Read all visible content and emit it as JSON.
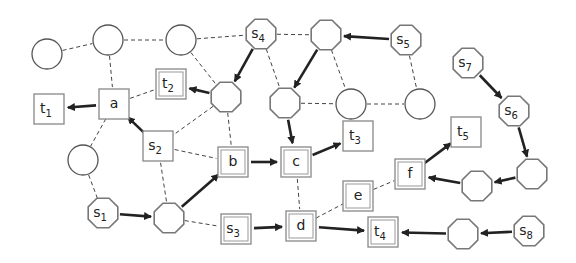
{
  "diagram": {
    "colors": {
      "stroke": "#555555",
      "arrow": "#222222",
      "background": "#ffffff"
    },
    "nodes": [
      {
        "id": "c1",
        "shape": "circle",
        "x": 47,
        "y": 54,
        "label": "",
        "sub": ""
      },
      {
        "id": "c2",
        "shape": "circle",
        "x": 108,
        "y": 40,
        "label": "",
        "sub": ""
      },
      {
        "id": "c3",
        "shape": "circle",
        "x": 181,
        "y": 40,
        "label": "",
        "sub": ""
      },
      {
        "id": "s4",
        "shape": "octagon",
        "x": 261,
        "y": 34,
        "label": "s",
        "sub": "4"
      },
      {
        "id": "o1",
        "shape": "octagon",
        "x": 326,
        "y": 35,
        "label": "",
        "sub": ""
      },
      {
        "id": "s5",
        "shape": "octagon",
        "x": 406,
        "y": 40,
        "label": "s",
        "sub": "5"
      },
      {
        "id": "a",
        "shape": "square",
        "x": 114,
        "y": 104,
        "label": "a",
        "sub": ""
      },
      {
        "id": "t1",
        "shape": "square",
        "x": 49,
        "y": 109,
        "label": "t",
        "sub": "1"
      },
      {
        "id": "t2",
        "shape": "dsquare",
        "x": 171,
        "y": 84,
        "label": "t",
        "sub": "2"
      },
      {
        "id": "o2",
        "shape": "octagon",
        "x": 226,
        "y": 97,
        "label": "",
        "sub": ""
      },
      {
        "id": "o3",
        "shape": "octagon",
        "x": 285,
        "y": 103,
        "label": "",
        "sub": ""
      },
      {
        "id": "c4",
        "shape": "circle",
        "x": 351,
        "y": 104,
        "label": "",
        "sub": ""
      },
      {
        "id": "c5",
        "shape": "circle",
        "x": 420,
        "y": 104,
        "label": "",
        "sub": ""
      },
      {
        "id": "s7",
        "shape": "octagon",
        "x": 468,
        "y": 63,
        "label": "s",
        "sub": "7"
      },
      {
        "id": "s6",
        "shape": "octagon",
        "x": 514,
        "y": 111,
        "label": "s",
        "sub": "6"
      },
      {
        "id": "c6",
        "shape": "circle",
        "x": 83,
        "y": 160,
        "label": "",
        "sub": ""
      },
      {
        "id": "s2",
        "shape": "square",
        "x": 158,
        "y": 146,
        "label": "s",
        "sub": "2"
      },
      {
        "id": "b",
        "shape": "dsquare",
        "x": 233,
        "y": 162,
        "label": "b",
        "sub": ""
      },
      {
        "id": "c",
        "shape": "dsquare",
        "x": 296,
        "y": 162,
        "label": "c",
        "sub": ""
      },
      {
        "id": "t3",
        "shape": "square",
        "x": 358,
        "y": 136,
        "label": "t",
        "sub": "3"
      },
      {
        "id": "t5",
        "shape": "square",
        "x": 466,
        "y": 132,
        "label": "t",
        "sub": "5"
      },
      {
        "id": "f",
        "shape": "dsquare",
        "x": 410,
        "y": 174,
        "label": "f",
        "sub": ""
      },
      {
        "id": "e",
        "shape": "dsquare",
        "x": 358,
        "y": 196,
        "label": "e",
        "sub": ""
      },
      {
        "id": "o4",
        "shape": "octagon",
        "x": 477,
        "y": 186,
        "label": "",
        "sub": ""
      },
      {
        "id": "o5",
        "shape": "octagon",
        "x": 532,
        "y": 174,
        "label": "",
        "sub": ""
      },
      {
        "id": "s1",
        "shape": "octagon",
        "x": 103,
        "y": 213,
        "label": "s",
        "sub": "1"
      },
      {
        "id": "o6",
        "shape": "octagon",
        "x": 169,
        "y": 218,
        "label": "",
        "sub": ""
      },
      {
        "id": "s3",
        "shape": "dsquare",
        "x": 236,
        "y": 229,
        "label": "s",
        "sub": "3"
      },
      {
        "id": "d",
        "shape": "dsquare",
        "x": 301,
        "y": 226,
        "label": "d",
        "sub": ""
      },
      {
        "id": "t4",
        "shape": "dsquare",
        "x": 383,
        "y": 232,
        "label": "t",
        "sub": "4"
      },
      {
        "id": "o7",
        "shape": "octagon",
        "x": 463,
        "y": 234,
        "label": "",
        "sub": ""
      },
      {
        "id": "s8",
        "shape": "octagon",
        "x": 529,
        "y": 231,
        "label": "s",
        "sub": "8"
      }
    ],
    "dashed_edges": [
      [
        "c1",
        "c2"
      ],
      [
        "c2",
        "c3"
      ],
      [
        "c3",
        "s4"
      ],
      [
        "s4",
        "o1"
      ],
      [
        "c2",
        "a"
      ],
      [
        "c3",
        "o2"
      ],
      [
        "s4",
        "o3"
      ],
      [
        "o1",
        "c4"
      ],
      [
        "s5",
        "c5"
      ],
      [
        "o3",
        "c4"
      ],
      [
        "c4",
        "c5"
      ],
      [
        "a",
        "t2"
      ],
      [
        "a",
        "c6"
      ],
      [
        "c6",
        "s1"
      ],
      [
        "o2",
        "s2"
      ],
      [
        "o2",
        "b"
      ],
      [
        "s2",
        "b"
      ],
      [
        "s2",
        "o6"
      ],
      [
        "o6",
        "s3"
      ],
      [
        "c",
        "d"
      ],
      [
        "d",
        "e"
      ],
      [
        "e",
        "f"
      ]
    ],
    "arrows": [
      [
        "s4",
        "o2"
      ],
      [
        "s5",
        "o1"
      ],
      [
        "o1",
        "o3"
      ],
      [
        "o2",
        "t2"
      ],
      [
        "a",
        "t1"
      ],
      [
        "s2",
        "a"
      ],
      [
        "o3",
        "c"
      ],
      [
        "b",
        "c"
      ],
      [
        "c",
        "t3"
      ],
      [
        "s7",
        "s6"
      ],
      [
        "s6",
        "o5"
      ],
      [
        "o5",
        "o4"
      ],
      [
        "o4",
        "f"
      ],
      [
        "f",
        "t5"
      ],
      [
        "s1",
        "o6"
      ],
      [
        "o6",
        "b"
      ],
      [
        "s3",
        "d"
      ],
      [
        "d",
        "t4"
      ],
      [
        "o7",
        "t4"
      ],
      [
        "s8",
        "o7"
      ]
    ]
  }
}
